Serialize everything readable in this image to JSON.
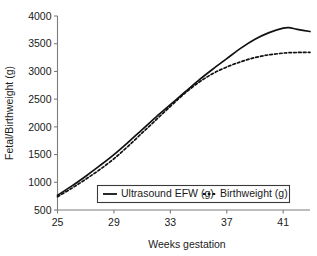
{
  "chart_data": {
    "type": "line",
    "title": "",
    "xlabel": "Weeks gestation",
    "ylabel": "Fetal/Birthweight (g)",
    "xlim": [
      25,
      42.9
    ],
    "ylim": [
      500,
      4000
    ],
    "xticks": [
      25,
      29,
      33,
      37,
      41
    ],
    "xtick_labels": [
      "25",
      "29",
      "33",
      "37",
      "41"
    ],
    "yticks": [
      500,
      1000,
      1500,
      2000,
      2500,
      3000,
      3500,
      4000
    ],
    "ytick_labels": [
      "500",
      "1000",
      "1500",
      "2000",
      "2500",
      "3000",
      "3500",
      "4000"
    ],
    "grid": false,
    "legend_position": "lower-center-inside",
    "x": [
      25,
      26,
      27,
      28,
      29,
      30,
      31,
      32,
      33,
      34,
      35,
      36,
      37,
      38,
      39,
      40,
      41,
      41.4,
      42,
      42.9
    ],
    "series": [
      {
        "name": "Ultrasound EFW (g)",
        "style": "solid",
        "color": "#111111",
        "values": [
          765,
          930,
          1110,
          1300,
          1500,
          1720,
          1950,
          2180,
          2400,
          2620,
          2840,
          3040,
          3230,
          3420,
          3580,
          3700,
          3780,
          3790,
          3760,
          3720
        ]
      },
      {
        "name": "Birthweight (g)",
        "style": "dashed",
        "color": "#111111",
        "values": [
          740,
          890,
          1055,
          1230,
          1425,
          1650,
          1890,
          2130,
          2370,
          2600,
          2800,
          2960,
          3080,
          3175,
          3250,
          3300,
          3330,
          3338,
          3342,
          3345
        ]
      }
    ]
  },
  "legend": {
    "entries": [
      {
        "label": "Ultrasound EFW (g)",
        "style": "solid"
      },
      {
        "label": "Birthweight (g)",
        "style": "dashed"
      }
    ]
  },
  "axes": {
    "x_title": "Weeks gestation",
    "y_title": "Fetal/Birthweight (g)"
  }
}
